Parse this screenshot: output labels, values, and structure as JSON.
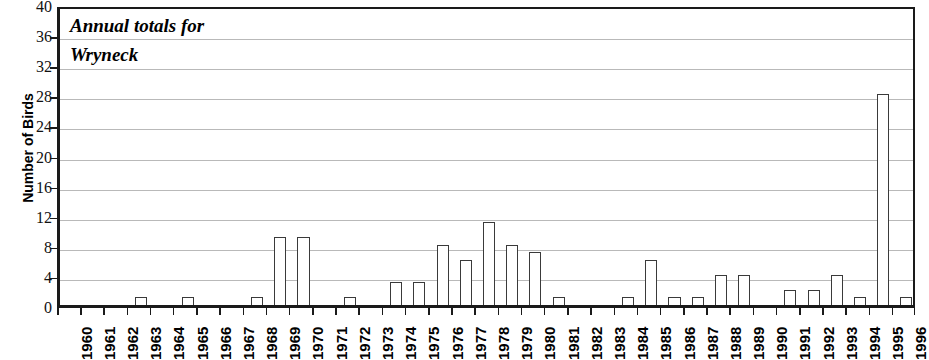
{
  "chart_data": {
    "type": "bar",
    "title": "Annual totals for Wryneck",
    "title_lines": [
      "Annual totals for",
      "Wryneck"
    ],
    "xlabel": "",
    "ylabel": "Number of Birds",
    "ylim": [
      0,
      40
    ],
    "ytick_step": 4,
    "yticks": [
      0,
      4,
      8,
      12,
      16,
      20,
      24,
      28,
      32,
      36,
      40
    ],
    "grid": true,
    "grid_axis": "y",
    "legend": "none",
    "categories": [
      "1960",
      "1961",
      "1962",
      "1963",
      "1964",
      "1965",
      "1966",
      "1967",
      "1968",
      "1969",
      "1970",
      "1971",
      "1972",
      "1973",
      "1974",
      "1975",
      "1976",
      "1977",
      "1978",
      "1979",
      "1980",
      "1981",
      "1982",
      "1983",
      "1984",
      "1985",
      "1986",
      "1987",
      "1988",
      "1989",
      "1990",
      "1991",
      "1992",
      "1993",
      "1994",
      "1995",
      "1996"
    ],
    "values": [
      0,
      0,
      0,
      1,
      0,
      1,
      0,
      0,
      1,
      9,
      9,
      0,
      1,
      0,
      3,
      3,
      8,
      6,
      11,
      8,
      7,
      1,
      0,
      0,
      1,
      6,
      1,
      1,
      4,
      4,
      0,
      2,
      2,
      4,
      1,
      28,
      1
    ],
    "bar_fill_color": "#ffffff",
    "bar_edge_color": "#3a3a3a",
    "axis_color": "#1a1a1a",
    "grid_color": "#b9b9b9"
  }
}
